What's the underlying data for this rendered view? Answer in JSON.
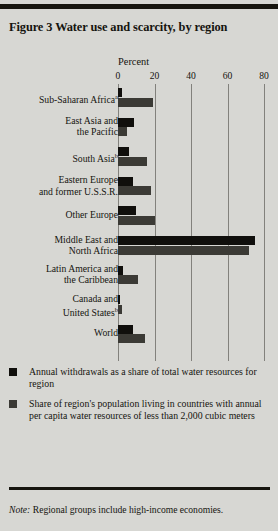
{
  "figure": {
    "title": "Figure 3  Water use and scarcity, by region"
  },
  "chart_data": {
    "type": "bar",
    "orientation": "horizontal",
    "title": "Figure 3  Water use and scarcity, by region",
    "xlabel": "Percent",
    "ylabel": "",
    "xlim": [
      0,
      80
    ],
    "xticks": [
      0,
      20,
      40,
      60,
      80
    ],
    "xtick_labels": [
      "0",
      "20",
      "40",
      "60",
      "80"
    ],
    "grid": true,
    "grid_axis": "x",
    "legend_position": "below",
    "categories": [
      "Sub-Saharan Africa",
      "East Asia and the Pacific",
      "South Asia",
      "Eastern Europe and former U.S.S.R.",
      "Other Europe",
      "Middle East and North Africa",
      "Latin America and the Caribbean",
      "Canada and United States",
      "World"
    ],
    "category_labels": [
      {
        "lines": [
          "Sub-Saharan Africa"
        ],
        "footnote": "a"
      },
      {
        "lines": [
          "East Asia and",
          "the Pacific"
        ],
        "footnote": ""
      },
      {
        "lines": [
          "South Asia"
        ],
        "footnote": "b"
      },
      {
        "lines": [
          "Eastern Europe",
          "and former U.S.S.R."
        ],
        "footnote": ""
      },
      {
        "lines": [
          "Other Europe"
        ],
        "footnote": ""
      },
      {
        "lines": [
          "Middle East and",
          "North Africa"
        ],
        "footnote": ""
      },
      {
        "lines": [
          "Latin America and",
          "the Caribbean"
        ],
        "footnote": ""
      },
      {
        "lines": [
          "Canada and",
          "United States"
        ],
        "footnote": "b"
      },
      {
        "lines": [
          "World"
        ],
        "footnote": ""
      }
    ],
    "series": [
      {
        "name": "Annual withdrawals as a share of total water resources for region",
        "color": "#100f0c",
        "values": [
          2,
          9,
          6,
          8,
          10,
          75,
          3,
          1,
          8
        ]
      },
      {
        "name": "Share of region's population living in countries with annual per capita water resources of less than 2,000 cubic meters",
        "color": "#3b3a35",
        "values": [
          19,
          5,
          16,
          18,
          20,
          72,
          11,
          2,
          15
        ]
      }
    ]
  },
  "legend": {
    "items": [
      {
        "swatch": "s1",
        "text": "Annual withdrawals as a share of total water resources for region"
      },
      {
        "swatch": "s2",
        "text": "Share of region's population living in countries with annual per capita water resources of less than 2,000 cubic meters"
      }
    ]
  },
  "note": {
    "label": "Note:",
    "text": " Regional groups include high-income economies."
  }
}
